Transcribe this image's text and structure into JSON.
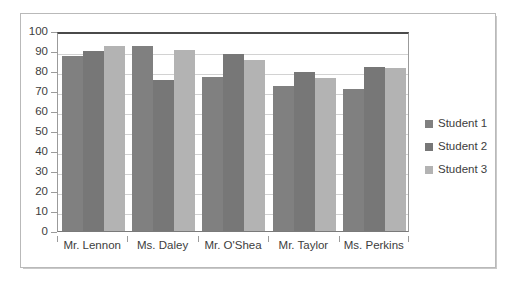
{
  "chart_data": {
    "type": "bar",
    "title": "",
    "subtitle": "",
    "xlabel": "",
    "ylabel": "",
    "categories": [
      "Mr. Lennon",
      "Ms. Daley",
      "Mr. O'Shea",
      "Mr. Taylor",
      "Ms. Perkins"
    ],
    "series": [
      {
        "name": "Student 1",
        "color": "#808080",
        "values": [
          87.5,
          92.5,
          77,
          72.5,
          71
        ]
      },
      {
        "name": "Student 2",
        "color": "#777777",
        "values": [
          90,
          75.5,
          88.5,
          79.5,
          82
        ]
      },
      {
        "name": "Student 3",
        "color": "#b3b3b3",
        "values": [
          92.5,
          90.5,
          85.5,
          76.5,
          81.5
        ]
      }
    ],
    "ylim": [
      0,
      100
    ],
    "ytick_step": 10,
    "ytick_labels": [
      "100",
      "90",
      "80",
      "70",
      "60",
      "50",
      "40",
      "30",
      "20",
      "10",
      "0"
    ],
    "grid": true,
    "grid_axis": "y",
    "legend_position": "right",
    "legend_entries": [
      "Student 1",
      "Student 2",
      "Student 3"
    ],
    "bar_grouping": "grouped",
    "annotations": []
  },
  "style": {
    "plot_border_color": "#9b9b9b",
    "plot_top_border_color": "#4a4a4a",
    "gridline_color": "#d2d2d2",
    "frame_border_color": "#b9b9b9",
    "background": "#ffffff",
    "text_color": "#3d3d3d"
  }
}
